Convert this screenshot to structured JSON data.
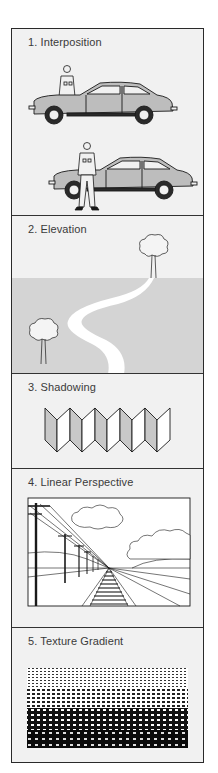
{
  "panels": [
    {
      "id": "interposition",
      "label": "1.  Interposition",
      "description": "Two cars with a person: one person behind the car, one person standing in front of the car"
    },
    {
      "id": "elevation",
      "label": "2.  Elevation",
      "description": "Winding white road receding toward the horizon with a small tree at the top and a tree in the lower foreground"
    },
    {
      "id": "shadowing",
      "label": "3.  Shadowing",
      "description": "Zig-zag folded strip of ten panels alternating shaded gray and white"
    },
    {
      "id": "linear-perspective",
      "label": "4.  Linear Perspective",
      "description": "Railroad tracks and telephone poles converging to a vanishing point under clouds"
    },
    {
      "id": "texture-gradient",
      "label": "5.  Texture Gradient",
      "description": "Field of marks that become finer and denser with distance"
    }
  ],
  "colors": {
    "background": "#f1f1f1",
    "border": "#2a2a2a",
    "ground_gray": "#d4d4d4",
    "car_gray": "#bdbdbd",
    "shade_gray": "#c8c8c8",
    "ink": "#1a1a1a"
  }
}
